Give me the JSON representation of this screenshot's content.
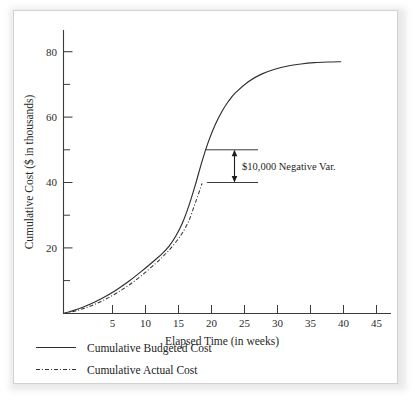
{
  "chart_data": {
    "type": "line",
    "title": "",
    "xlabel": "Elapsed Time (in weeks)",
    "ylabel": "Cumulative Cost ($ in thousands)",
    "xlim": [
      0,
      47
    ],
    "ylim": [
      0,
      87
    ],
    "grid": false,
    "legend_position": "below-axis-left",
    "x_ticks_major": [
      5,
      10,
      15,
      20,
      25,
      30,
      35,
      40,
      45
    ],
    "x_tick_labels": [
      "5",
      "10",
      "15",
      "20",
      "25",
      "30",
      "35",
      "40",
      "45"
    ],
    "y_ticks_major": [
      20,
      40,
      60,
      80
    ],
    "y_tick_labels": [
      "20",
      "40",
      "60",
      "80"
    ],
    "y_ticks_minor": [
      10,
      30,
      50,
      70
    ],
    "series": [
      {
        "name": "Cumulative Budgeted Cost",
        "style": "solid",
        "color": "#2e2e2e",
        "x": [
          0,
          2,
          4,
          6,
          8,
          10,
          12,
          14,
          15,
          16,
          17,
          18,
          19,
          20,
          21,
          22,
          23,
          24,
          25,
          26,
          28,
          30,
          32,
          34,
          36,
          38,
          40,
          42
        ],
        "y": [
          0,
          1.2,
          2.8,
          4.8,
          7.2,
          10.0,
          13.2,
          16.6,
          18.4,
          20.6,
          23.6,
          27.6,
          33.0,
          39.5,
          46.6,
          52.8,
          57.8,
          61.8,
          64.9,
          67.4,
          70.9,
          73.2,
          74.7,
          75.7,
          76.3,
          76.7,
          76.9,
          77.0
        ]
      },
      {
        "name": "Cumulative Actual Cost",
        "style": "dash-dot",
        "color": "#343434",
        "x": [
          0,
          2,
          4,
          6,
          8,
          10,
          12,
          14,
          15,
          16,
          17,
          18,
          19,
          20,
          21
        ],
        "y": [
          0,
          0.9,
          2.2,
          4.0,
          6.2,
          8.8,
          11.9,
          15.4,
          17.3,
          19.4,
          21.8,
          24.6,
          28.4,
          34.0,
          39.8
        ]
      }
    ],
    "annotations": [
      {
        "text": "$10,000 Negative Var.",
        "kind": "double-arrow-with-leaders",
        "y_top": 50,
        "y_bottom": 40,
        "leader_x_start_top": 21.5,
        "leader_x_start_bottom": 21.8,
        "leader_x_end": 29.5,
        "arrow_x": 26.0
      }
    ]
  },
  "legend": {
    "items": [
      {
        "label": "Cumulative Budgeted Cost",
        "swatch": "solid-line-swatch"
      },
      {
        "label": "Cumulative Actual Cost",
        "swatch": "dash-dot-line-swatch"
      }
    ]
  }
}
